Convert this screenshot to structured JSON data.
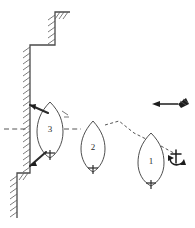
{
  "diagram": {
    "background_color": "#ffffff",
    "line_color": "#3a3a3a",
    "width": 195,
    "height": 228
  },
  "ships": [
    {
      "id": "ship-1",
      "label": "1",
      "cx": 151,
      "cy": 159,
      "half_width": 13,
      "half_length": 28,
      "description": "anchored vessel offshore with anchor deployed"
    },
    {
      "id": "ship-2",
      "label": "2",
      "cx": 93,
      "cy": 146,
      "half_width": 12,
      "half_length": 25,
      "description": "vessel at intermediate approach position"
    },
    {
      "id": "ship-3",
      "label": "3",
      "cx": 50,
      "cy": 129,
      "half_width": 13,
      "half_length": 27,
      "description": "vessel moored alongside quay wall"
    }
  ],
  "centerline": {
    "name": "approach-centerline",
    "y": 129,
    "x_start": 4,
    "x_end": 120,
    "style": "dashed"
  },
  "anchor_chain": {
    "name": "anchor-chain",
    "style": "dashed",
    "from": "ship-1 bow",
    "to": "anchor symbol"
  },
  "anchor": {
    "name": "anchor-symbol",
    "x": 176,
    "y": 158
  },
  "flow_indicator": {
    "name": "current-direction-arrow",
    "direction": "left",
    "x_tail": 178,
    "x_head": 152,
    "y": 104,
    "symbol": "hatched-flag"
  },
  "quay_wall": {
    "name": "quay-wall",
    "hatching_side": "left",
    "segments": [
      {
        "from": [
          55,
          12
        ],
        "to": [
          55,
          45
        ]
      },
      {
        "from": [
          55,
          45
        ],
        "to": [
          30,
          45
        ]
      },
      {
        "from": [
          30,
          45
        ],
        "to": [
          30,
          173
        ]
      },
      {
        "from": [
          30,
          173
        ],
        "to": [
          17,
          173
        ]
      },
      {
        "from": [
          17,
          173
        ],
        "to": [
          17,
          218
        ]
      }
    ]
  },
  "mooring_lines": [
    {
      "name": "bow-mooring-line",
      "from": [
        28,
        106
      ],
      "to": [
        47,
        115
      ]
    },
    {
      "name": "stern-mooring-line",
      "from": [
        28,
        166
      ],
      "to": [
        46,
        153
      ]
    }
  ]
}
